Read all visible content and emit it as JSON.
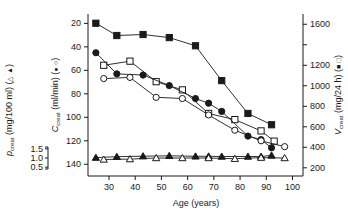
{
  "chart_data": {
    "type": "line",
    "title": "",
    "xlabel": "Age (years)",
    "ylabel": "C_creat (ml/min)",
    "y2label": "V_creat (mg/24 h)",
    "y3label": "p_creat (mg/100 ml)",
    "xlim": [
      22,
      104
    ],
    "ylim": [
      10,
      148
    ],
    "y2lim": [
      120,
      1700
    ],
    "y3lim": [
      0.4,
      1.6
    ],
    "grid": false,
    "legend_position": "inline-axis-labels",
    "xticks": [
      30,
      40,
      50,
      60,
      70,
      80,
      90,
      100
    ],
    "yticks": [
      20,
      40,
      60,
      80,
      100,
      120,
      140
    ],
    "y2ticks": [
      200,
      400,
      600,
      800,
      1000,
      1200,
      1600
    ],
    "y3ticks": [
      0.5,
      1.0,
      1.5
    ],
    "series": [
      {
        "name": "V_creat men",
        "marker": "filled-square",
        "axis": "right",
        "x": [
          25,
          33,
          43,
          53,
          63,
          73,
          83,
          92
        ],
        "values": [
          1610,
          1490,
          1500,
          1470,
          1390,
          1050,
          730,
          620
        ]
      },
      {
        "name": "V_creat women",
        "marker": "open-square",
        "axis": "right",
        "x": [
          28,
          38,
          48,
          58,
          68,
          78,
          88,
          93
        ],
        "values": [
          1200,
          1240,
          1040,
          960,
          730,
          670,
          560,
          460
        ]
      },
      {
        "name": "C_creat men",
        "marker": "filled-circle",
        "axis": "left",
        "x": [
          25,
          33,
          43,
          53,
          63,
          68,
          73,
          83,
          88,
          92
        ],
        "values": [
          115,
          97,
          96,
          87,
          76,
          72,
          65,
          44,
          41,
          34
        ]
      },
      {
        "name": "C_creat women",
        "marker": "open-circle",
        "axis": "left",
        "x": [
          28,
          38,
          48,
          58,
          68,
          78,
          88,
          97
        ],
        "values": [
          93,
          94,
          77,
          76,
          62,
          49,
          40,
          35
        ]
      },
      {
        "name": "p_creat men",
        "marker": "filled-triangle",
        "axis": "p",
        "x": [
          25,
          33,
          43,
          53,
          63,
          68,
          73,
          83,
          88,
          92
        ],
        "values": [
          1.02,
          1.07,
          1.1,
          1.12,
          1.09,
          1.09,
          1.08,
          1.08,
          1.08,
          1.14
        ]
      },
      {
        "name": "p_creat women",
        "marker": "open-triangle",
        "axis": "p",
        "x": [
          28,
          38,
          48,
          58,
          68,
          78,
          88,
          97
        ],
        "values": [
          0.92,
          0.94,
          1.0,
          1.0,
          1.0,
          0.96,
          1.02,
          1.0
        ]
      }
    ]
  },
  "axes": {
    "x": {
      "label": "Age (years)",
      "ticks": [
        "30",
        "40",
        "50",
        "60",
        "70",
        "80",
        "90",
        "100"
      ]
    },
    "y_left": {
      "label_main": "C",
      "label_sub": "creat",
      "label_unit": " (ml/min) (",
      "label_marker_filled": "●",
      "label_marker_open": "○",
      "label_close": ")",
      "ticks": [
        "140",
        "120",
        "100",
        "80",
        "60",
        "40",
        "20"
      ]
    },
    "y_right": {
      "label_main": "V",
      "label_sub": "creat",
      "label_unit": " (mg/24 h) (",
      "label_marker_filled": "■",
      "label_marker_open": "□",
      "label_close": ")",
      "ticks": [
        "1600",
        "1200",
        "1000",
        "800",
        "600",
        "400",
        "200"
      ]
    },
    "y_p": {
      "label_main": "p",
      "label_sub": "creat",
      "label_unit": " (mg/100 ml) (",
      "label_marker_open": "△",
      "label_marker_filled": "▲",
      "label_close": ")",
      "ticks": [
        "1.5",
        "1.0",
        "0.5"
      ]
    }
  },
  "colors": {
    "ink": "#1a1a1a",
    "line": "#2b2b2b",
    "background": "#ffffff"
  }
}
